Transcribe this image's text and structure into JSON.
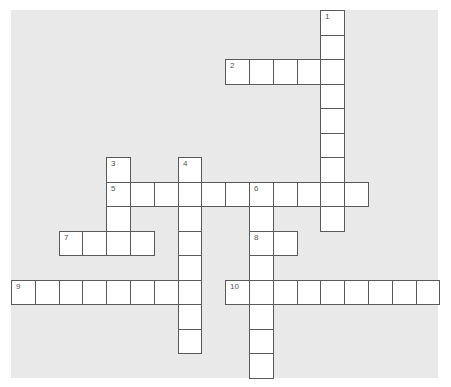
{
  "puzzle": {
    "type": "crossword",
    "grid_origin": {
      "x": 11,
      "y": 10
    },
    "cell_width": 23.8,
    "cell_height": 24.5,
    "colors": {
      "background": "#e9e9e9",
      "cell": "#ffffff",
      "border": "#5a5a5a",
      "number": "#555555"
    },
    "entries": [
      {
        "number": "1",
        "direction": "down",
        "row": 0,
        "col": 13,
        "length": 9
      },
      {
        "number": "2",
        "direction": "across",
        "row": 2,
        "col": 9,
        "length": 5
      },
      {
        "number": "3",
        "direction": "down",
        "row": 6,
        "col": 4,
        "length": 4
      },
      {
        "number": "4",
        "direction": "down",
        "row": 6,
        "col": 7,
        "length": 8
      },
      {
        "number": "5",
        "direction": "across",
        "row": 7,
        "col": 4,
        "length": 11
      },
      {
        "number": "6",
        "direction": "down",
        "row": 7,
        "col": 10,
        "length": 8
      },
      {
        "number": "7",
        "direction": "across",
        "row": 9,
        "col": 2,
        "length": 4
      },
      {
        "number": "8",
        "direction": "across",
        "row": 9,
        "col": 10,
        "length": 2
      },
      {
        "number": "9",
        "direction": "across",
        "row": 11,
        "col": 0,
        "length": 8
      },
      {
        "number": "10",
        "direction": "across",
        "row": 11,
        "col": 9,
        "length": 9
      }
    ]
  }
}
